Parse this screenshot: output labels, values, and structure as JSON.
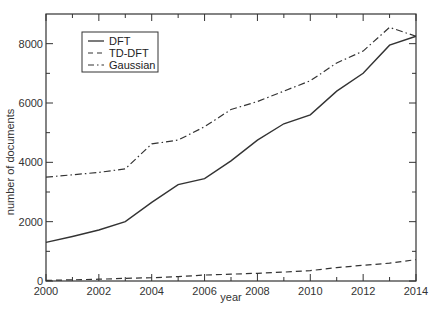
{
  "chart_data": {
    "type": "line",
    "title": "",
    "xlabel": "year",
    "ylabel": "number of documents",
    "xlim": [
      2000,
      2014
    ],
    "ylim": [
      0,
      9000
    ],
    "grid": false,
    "legend_position": "upper-left",
    "x": [
      2000,
      2001,
      2002,
      2003,
      2004,
      2005,
      2006,
      2007,
      2008,
      2009,
      2010,
      2011,
      2012,
      2013,
      2014
    ],
    "x_ticks": [
      2000,
      2002,
      2004,
      2006,
      2008,
      2010,
      2012,
      2014
    ],
    "x_minor_ticks": [
      2001,
      2003,
      2005,
      2007,
      2009,
      2011,
      2013
    ],
    "y_ticks": [
      0,
      2000,
      4000,
      6000,
      8000
    ],
    "y_minor_ticks": [
      1000,
      3000,
      5000,
      7000
    ],
    "series": [
      {
        "name": "DFT",
        "style": "solid",
        "values": [
          1300,
          1500,
          1720,
          2000,
          2650,
          3250,
          3450,
          4050,
          4750,
          5300,
          5600,
          6400,
          7000,
          7950,
          8250
        ]
      },
      {
        "name": "TD-DFT",
        "style": "dashed",
        "values": [
          20,
          40,
          60,
          90,
          110,
          150,
          200,
          230,
          260,
          300,
          350,
          450,
          530,
          600,
          720
        ]
      },
      {
        "name": "Gaussian",
        "style": "dash-dot",
        "values": [
          3500,
          3580,
          3660,
          3780,
          4620,
          4750,
          5200,
          5780,
          6050,
          6400,
          6750,
          7350,
          7750,
          8550,
          8250
        ]
      }
    ]
  },
  "colors": {
    "line": "#333333",
    "axis": "#333333"
  }
}
